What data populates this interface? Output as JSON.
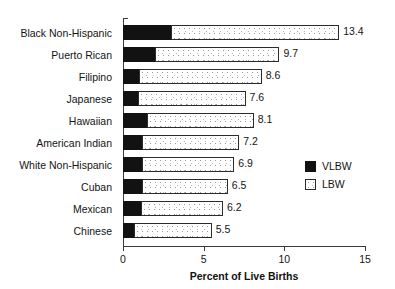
{
  "chart_data": {
    "type": "bar",
    "orientation": "horizontal",
    "stacked": true,
    "title": "",
    "subtitle": "",
    "xlabel": "Percent of Live Births",
    "ylabel": "",
    "xlim": [
      0,
      15
    ],
    "ylim": null,
    "grid": false,
    "legend_position": "right-middle",
    "xticks": [
      0,
      5,
      10,
      15
    ],
    "xtick_labels": [
      "0",
      "5",
      "10",
      "15"
    ],
    "categories": [
      "Black Non-Hispanic",
      "Puerto Rican",
      "Filipino",
      "Japanese",
      "Hawaiian",
      "American Indian",
      "White Non-Hispanic",
      "Cuban",
      "Mexican",
      "Chinese"
    ],
    "series": [
      {
        "name": "VLBW",
        "color": "#121212",
        "values": [
          3.0,
          2.0,
          1.0,
          0.9,
          1.5,
          1.2,
          1.2,
          1.2,
          1.1,
          0.7
        ]
      },
      {
        "name": "LBW",
        "color": "#ffffff",
        "values": [
          10.4,
          7.7,
          7.6,
          6.7,
          6.6,
          6.0,
          5.7,
          5.3,
          5.1,
          4.8
        ]
      }
    ],
    "totals": [
      13.4,
      9.7,
      8.6,
      7.6,
      8.1,
      7.2,
      6.9,
      6.5,
      6.2,
      5.5
    ],
    "data_labels": [
      "13.4",
      "9.7",
      "8.6",
      "7.6",
      "8.1",
      "7.2",
      "6.9",
      "6.5",
      "6.2",
      "5.5"
    ],
    "legend_entries": [
      {
        "label": "VLBW",
        "swatch": "filled-black"
      },
      {
        "label": "LBW",
        "swatch": "dotted-white"
      }
    ]
  }
}
